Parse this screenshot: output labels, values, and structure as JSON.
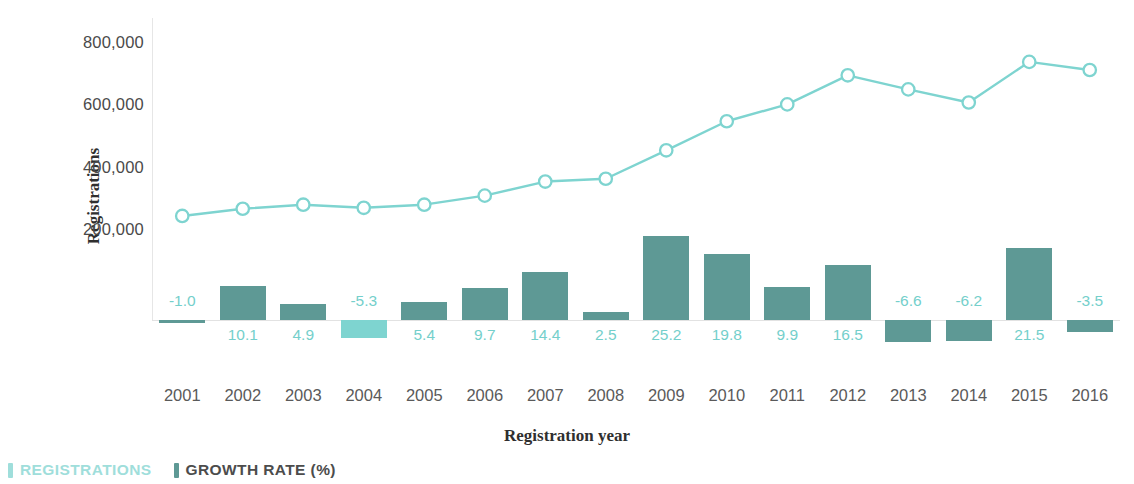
{
  "chart_data": {
    "type": "bar",
    "title": "",
    "subtitle": "",
    "xlabel": "Registration year",
    "ylabel": "Registrations",
    "categories": [
      "2001",
      "2002",
      "2003",
      "2004",
      "2005",
      "2006",
      "2007",
      "2008",
      "2009",
      "2010",
      "2011",
      "2012",
      "2013",
      "2014",
      "2015",
      "2016"
    ],
    "ylim": [
      0,
      800000
    ],
    "y_ticks": [
      "200,000",
      "400,000",
      "600,000",
      "800,000"
    ],
    "y_tick_values": [
      200000,
      400000,
      600000,
      800000
    ],
    "grid": false,
    "legend_position": "bottom-left",
    "series": [
      {
        "name": "REGISTRATIONS",
        "type": "line",
        "axis": "left",
        "color": "#7ed4d0",
        "marker": "open-circle",
        "values": [
          245000,
          268000,
          281000,
          271000,
          281000,
          310000,
          355000,
          364000,
          455000,
          548000,
          602000,
          695000,
          650000,
          608000,
          738000,
          712000
        ]
      },
      {
        "name": "GROWTH RATE (%)",
        "type": "bar",
        "axis": "right",
        "color": "#5e9995",
        "color_alt": "#7ed4d0",
        "values": [
          -1.0,
          10.1,
          4.9,
          -5.3,
          5.4,
          9.7,
          14.4,
          2.5,
          25.2,
          19.8,
          9.9,
          16.5,
          -6.6,
          -6.2,
          21.5,
          -3.5
        ],
        "labels": [
          "-1.0",
          "10.1",
          "4.9",
          "-5.3",
          "5.4",
          "9.7",
          "14.4",
          "2.5",
          "25.2",
          "19.8",
          "9.9",
          "16.5",
          "-6.6",
          "-6.2",
          "21.5",
          "-3.5"
        ]
      }
    ]
  },
  "axis": {
    "y_title": "Registrations",
    "x_title": "Registration year"
  },
  "legend": {
    "items": [
      {
        "label_main": "REGISTRATIONS",
        "label_suffix": "",
        "color": "#9fdedb",
        "text_color": "#9fdedb"
      },
      {
        "label_main": "GROWTH RATE",
        "label_suffix": " (%)",
        "color": "#5e9995",
        "text_color": "#4c4c4c"
      }
    ]
  }
}
